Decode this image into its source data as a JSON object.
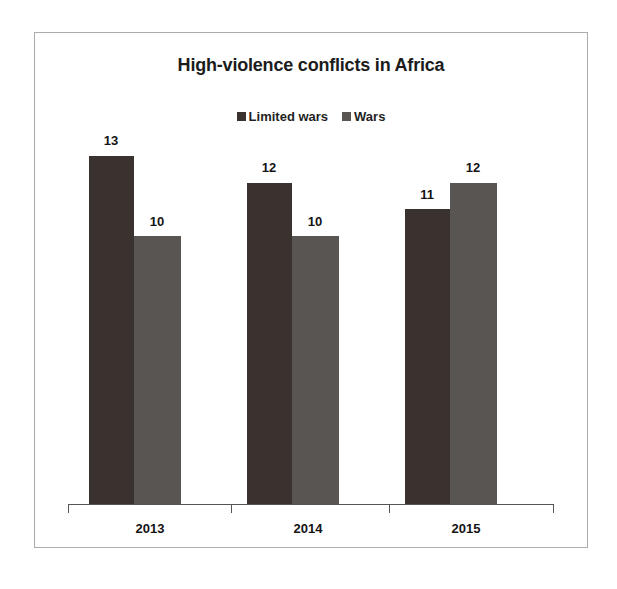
{
  "chart_data": {
    "type": "bar",
    "title": "High-violence conflicts in Africa",
    "categories": [
      "2013",
      "2014",
      "2015"
    ],
    "series": [
      {
        "name": "Limited wars",
        "values": [
          13,
          12,
          11
        ],
        "color": "#3a322f"
      },
      {
        "name": "Wars",
        "values": [
          10,
          10,
          12
        ],
        "color": "#595553"
      }
    ],
    "xlabel": "",
    "ylabel": "",
    "ylim": [
      0,
      14
    ],
    "grid": false,
    "legend_position": "top-center",
    "axis_ticks_visible": true
  },
  "legend": {
    "items": [
      {
        "label": "Limited wars",
        "swatch": "dark-square-marker"
      },
      {
        "label": "Wars",
        "swatch": "gray-square-marker"
      }
    ]
  },
  "labels": {
    "g2013_limited": "13",
    "g2013_wars": "10",
    "g2014_limited": "12",
    "g2014_wars": "10",
    "g2015_limited": "11",
    "g2015_wars": "12",
    "cat_2013": "2013",
    "cat_2014": "2014",
    "cat_2015": "2015"
  }
}
